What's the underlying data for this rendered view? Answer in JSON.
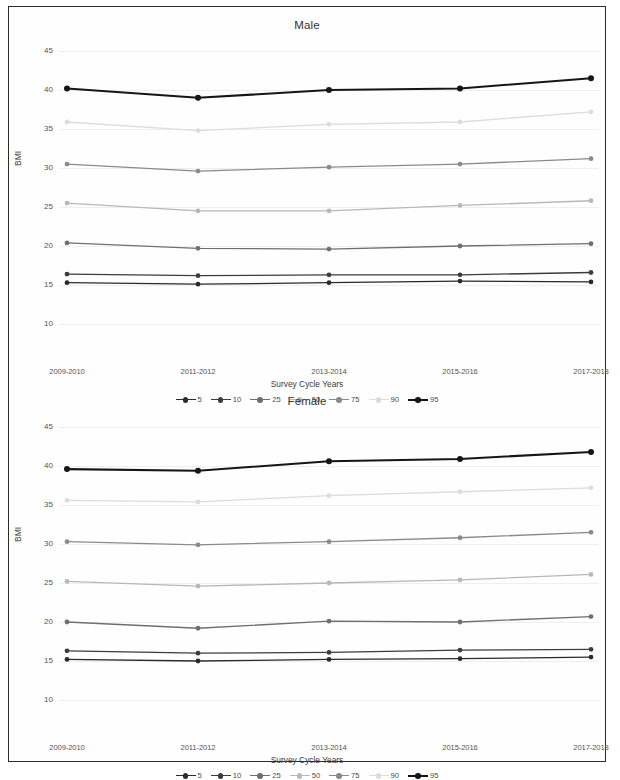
{
  "figure": {
    "y_axis_label": "BMI",
    "x_axis_label": "Survey Cycle Years",
    "y_ticks": [
      "45",
      "40",
      "35",
      "30",
      "25",
      "20",
      "15",
      "10"
    ],
    "x_ticks": [
      "2009-2010",
      "2011-2012",
      "2013-2014",
      "2015-2016",
      "2017-2018"
    ]
  },
  "panels": {
    "male": {
      "title": "Male"
    },
    "female": {
      "title": "Female"
    }
  },
  "legend": {
    "items": [
      {
        "label": "5",
        "color": "#2b2b2b"
      },
      {
        "label": "10",
        "color": "#3d3d3d"
      },
      {
        "label": "25",
        "color": "#6f6f6f"
      },
      {
        "label": "50",
        "color": "#b8b8b8"
      },
      {
        "label": "75",
        "color": "#8a8a8a"
      },
      {
        "label": "90",
        "color": "#dcdcdc"
      },
      {
        "label": "95",
        "color": "#161616"
      }
    ]
  },
  "chart_data": [
    {
      "type": "line",
      "title": "Male",
      "xlabel": "Survey Cycle Years",
      "ylabel": "BMI",
      "categories": [
        "2009-2010",
        "2011-2012",
        "2013-2014",
        "2015-2016",
        "2017-2018"
      ],
      "ylim": [
        10,
        45
      ],
      "ytick_step": 5,
      "grid": true,
      "legend_position": "bottom",
      "series": [
        {
          "name": "5",
          "color": "#2b2b2b",
          "values": [
            15.3,
            15.1,
            15.3,
            15.5,
            15.4
          ]
        },
        {
          "name": "10",
          "color": "#3d3d3d",
          "values": [
            16.4,
            16.2,
            16.3,
            16.3,
            16.6
          ]
        },
        {
          "name": "25",
          "color": "#6f6f6f",
          "values": [
            20.4,
            19.7,
            19.6,
            20.0,
            20.3
          ]
        },
        {
          "name": "50",
          "color": "#b8b8b8",
          "values": [
            25.5,
            24.5,
            24.5,
            25.2,
            25.8
          ]
        },
        {
          "name": "75",
          "color": "#8a8a8a",
          "values": [
            30.5,
            29.6,
            30.1,
            30.5,
            31.2
          ]
        },
        {
          "name": "90",
          "color": "#dcdcdc",
          "values": [
            35.9,
            34.8,
            35.6,
            35.9,
            37.2
          ]
        },
        {
          "name": "95",
          "color": "#161616",
          "values": [
            40.2,
            39.0,
            40.0,
            40.2,
            41.5
          ]
        }
      ]
    },
    {
      "type": "line",
      "title": "Female",
      "xlabel": "Survey Cycle Years",
      "ylabel": "BMI",
      "categories": [
        "2009-2010",
        "2011-2012",
        "2013-2014",
        "2015-2016",
        "2017-2018"
      ],
      "ylim": [
        10,
        45
      ],
      "ytick_step": 5,
      "grid": true,
      "legend_position": "bottom",
      "series": [
        {
          "name": "5",
          "color": "#2b2b2b",
          "values": [
            15.2,
            15.0,
            15.2,
            15.3,
            15.5
          ]
        },
        {
          "name": "10",
          "color": "#3d3d3d",
          "values": [
            16.3,
            16.0,
            16.1,
            16.4,
            16.5
          ]
        },
        {
          "name": "25",
          "color": "#6f6f6f",
          "values": [
            20.0,
            19.2,
            20.1,
            20.0,
            20.7
          ]
        },
        {
          "name": "50",
          "color": "#b8b8b8",
          "values": [
            25.2,
            24.6,
            25.0,
            25.4,
            26.1
          ]
        },
        {
          "name": "75",
          "color": "#8a8a8a",
          "values": [
            30.3,
            29.9,
            30.3,
            30.8,
            31.5
          ]
        },
        {
          "name": "90",
          "color": "#dcdcdc",
          "values": [
            35.6,
            35.4,
            36.2,
            36.7,
            37.2
          ]
        },
        {
          "name": "95",
          "color": "#161616",
          "values": [
            39.6,
            39.4,
            40.6,
            40.9,
            41.8
          ]
        }
      ]
    }
  ]
}
